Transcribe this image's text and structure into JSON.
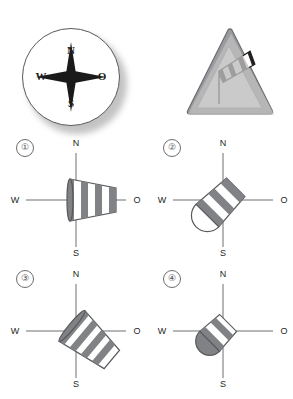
{
  "figure": {
    "title_visible": false,
    "background": "#ffffff"
  },
  "top_row": {
    "compass": {
      "name": "compass-rose",
      "labels": {
        "north": "N",
        "east": "O",
        "south": "S",
        "west": "W"
      },
      "star_color": "#1a1a1a",
      "disc_color": "#ffffff",
      "border_color": "#58595b"
    },
    "road_sign": {
      "name": "crosswind-warning-sign",
      "shape": "triangle",
      "border_color": "#808285",
      "inner_color": "#ffffff",
      "windsock_stripe_dark": "#231f20",
      "windsock_stripe_light": "#ffffff",
      "pole_color": "#58595b",
      "windsock_direction": "up-right"
    }
  },
  "options": [
    {
      "number": "①",
      "name": "option-1",
      "labels": {
        "north": "N",
        "east": "O",
        "south": "S",
        "west": "W"
      },
      "windsock": {
        "direction": "east",
        "angle_deg": 0,
        "extension": "full",
        "stripes": 4,
        "stripe_dark": "#808285",
        "stripe_light": "#ffffff",
        "outline": "#58595b"
      }
    },
    {
      "number": "②",
      "name": "option-2",
      "labels": {
        "north": "N",
        "east": "O",
        "south": "S",
        "west": "W"
      },
      "windsock": {
        "direction": "northeast",
        "angle_deg": -45,
        "extension": "collapsed",
        "stripes": 3,
        "stripe_dark": "#808285",
        "stripe_light": "#ffffff",
        "outline": "#58595b"
      }
    },
    {
      "number": "③",
      "name": "option-3",
      "labels": {
        "north": "N",
        "east": "O",
        "south": "S",
        "west": "W"
      },
      "windsock": {
        "direction": "southeast",
        "angle_deg": 40,
        "extension": "full",
        "stripes": 5,
        "stripe_dark": "#808285",
        "stripe_light": "#ffffff",
        "outline": "#58595b"
      }
    },
    {
      "number": "④",
      "name": "option-4",
      "labels": {
        "north": "N",
        "east": "O",
        "south": "S",
        "west": "W"
      },
      "windsock": {
        "direction": "northeast",
        "angle_deg": -45,
        "extension": "very-collapsed",
        "stripes": 2,
        "stripe_dark": "#808285",
        "stripe_light": "#ffffff",
        "outline": "#58595b"
      }
    }
  ],
  "colors": {
    "axis": "#6d6e71",
    "text": "#231f20",
    "gray": "#808285"
  }
}
